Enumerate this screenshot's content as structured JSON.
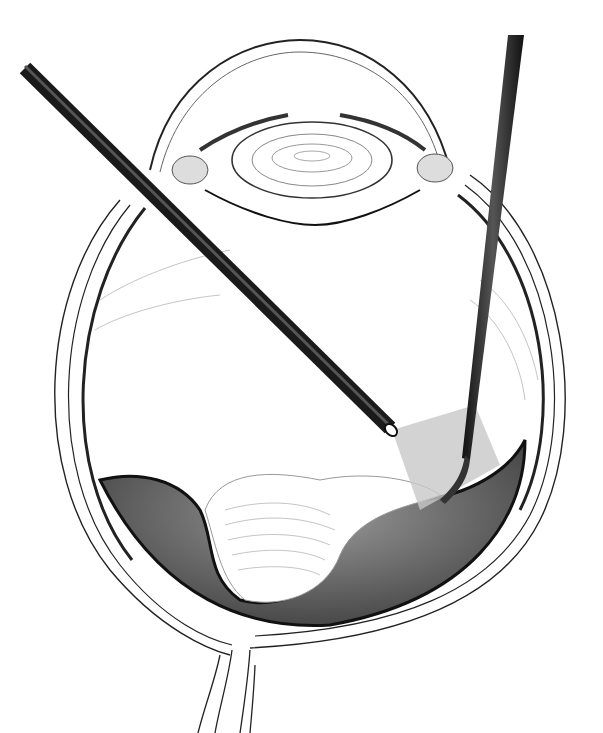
{
  "image": {
    "subject": "eye-cross-section-vitrectomy-illustration",
    "background": "#ffffff",
    "colors": {
      "line": "#222222",
      "fine_line": "#888888",
      "instrument": "#2a2a2a",
      "retina_shadow": "#4a4a4a",
      "light_cone": "#bdbdbd"
    },
    "elements": [
      "cornea",
      "lens",
      "iris",
      "ciliary-body",
      "sclera",
      "retina",
      "vitreous",
      "optic-nerve",
      "light-pipe",
      "vitrector"
    ]
  }
}
